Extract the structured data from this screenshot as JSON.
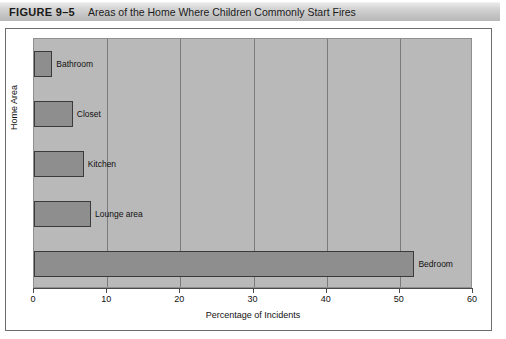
{
  "figure": {
    "number": "FIGURE 9–5",
    "caption": "Areas of the Home Where Children Commonly Start Fires"
  },
  "chart_data": {
    "type": "bar",
    "orientation": "horizontal",
    "title": "Areas of the Home Where Children Commonly Start Fires",
    "categories": [
      "Bathroom",
      "Closet",
      "Kitchen",
      "Lounge area",
      "Bedroom"
    ],
    "values": [
      2.5,
      5.3,
      6.8,
      7.8,
      52
    ],
    "xlabel": "Percentage of Incidents",
    "ylabel": "Home Area",
    "xlim": [
      0,
      60
    ],
    "xticks": [
      "0",
      "10",
      "20",
      "30",
      "40",
      "50",
      "60"
    ],
    "grid": "vertical",
    "legend": "none",
    "bar_fill": "#8e8e8e",
    "bar_stroke": "#3a3a3a",
    "plot_background": "#b9b9b9"
  }
}
